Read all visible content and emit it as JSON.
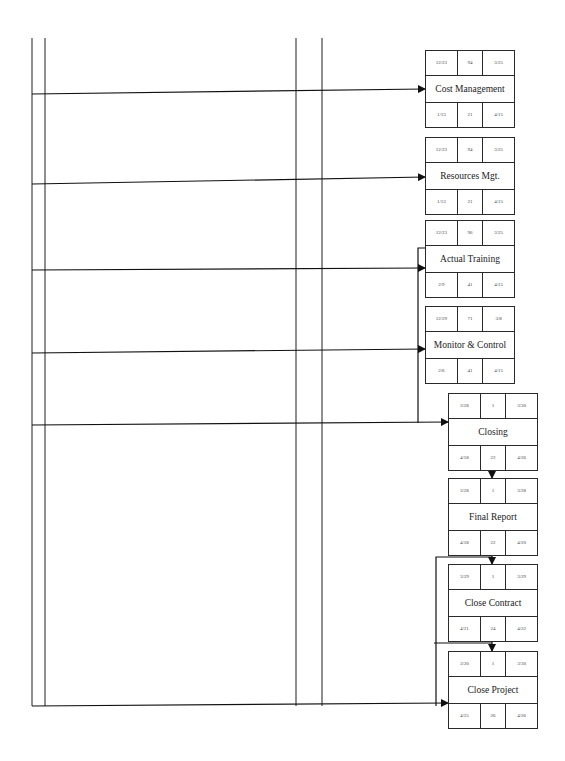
{
  "diagram": {
    "type": "network-diagram",
    "nodes": [
      {
        "id": "cost-management",
        "label": "Cost Management",
        "top": [
          "12/23",
          "94",
          "3/25"
        ],
        "bottom": [
          "1/13",
          "21",
          "4/15"
        ]
      },
      {
        "id": "resources-mgt",
        "label": "Resources Mgt.",
        "top": [
          "12/23",
          "94",
          "3/25"
        ],
        "bottom": [
          "1/13",
          "21",
          "4/15"
        ]
      },
      {
        "id": "actual-training",
        "label": "Actual Training",
        "top": [
          "12/23",
          "96",
          "3/25"
        ],
        "bottom": [
          "2/9",
          "41",
          "4/15"
        ]
      },
      {
        "id": "monitor-control",
        "label": "Monitor & Control",
        "top": [
          "12/29",
          "71",
          "3/8"
        ],
        "bottom": [
          "2/6",
          "41",
          "4/15"
        ]
      },
      {
        "id": "closing",
        "label": "Closing",
        "top": [
          "3/28",
          "1",
          "3/30"
        ],
        "bottom": [
          "4/18",
          "22",
          "4/26"
        ]
      },
      {
        "id": "final-report",
        "label": "Final Report",
        "top": [
          "3/28",
          "1",
          "3/28"
        ],
        "bottom": [
          "4/18",
          "22",
          "4/20"
        ]
      },
      {
        "id": "close-contract",
        "label": "Close Contract",
        "top": [
          "3/29",
          "1",
          "3/29"
        ],
        "bottom": [
          "4/21",
          "24",
          "4/22"
        ]
      },
      {
        "id": "close-project",
        "label": "Close Project",
        "top": [
          "3/30",
          "1",
          "3/30"
        ],
        "bottom": [
          "4/25",
          "26",
          "4/26"
        ]
      }
    ]
  }
}
